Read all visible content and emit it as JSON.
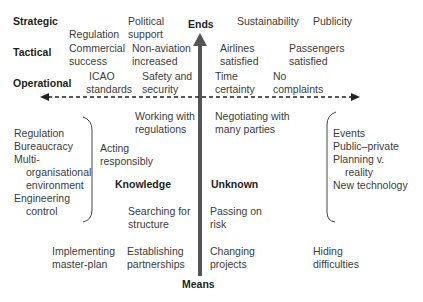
{
  "axes": {
    "vertical": {
      "top_label": "Ends",
      "bottom_label": "Means"
    },
    "horizontal": {
      "style": "dashed",
      "bidirectional": true
    }
  },
  "levels": [
    {
      "label": "Strategic"
    },
    {
      "label": "Tactical"
    },
    {
      "label": "Operational"
    }
  ],
  "ends": {
    "strategic": [
      "Regulation",
      "Political support",
      "Sustainability",
      "Publicity"
    ],
    "tactical": [
      "Commercial success",
      "Non-aviation increased",
      "Airlines satisfied",
      "Passengers satisfied"
    ],
    "operational": [
      "ICAO standards",
      "Safety and security",
      "Time certainty",
      "No complaints"
    ]
  },
  "quadrants": {
    "knowledge": {
      "label": "Knowledge",
      "items": [
        "Working with regulations",
        "Acting responsibly",
        "Searching for structure"
      ]
    },
    "unknown": {
      "label": "Unknown",
      "items": [
        "Negotiating with many parties",
        "Passing on risk"
      ]
    }
  },
  "left_group": {
    "items": [
      "Regulation",
      "Bureaucracy",
      "Multi-",
      "organisational",
      "environment",
      "Engineering",
      "control"
    ]
  },
  "right_group": {
    "items": [
      "Events",
      "Public–private",
      "Planning v.",
      "reality",
      "New technology"
    ]
  },
  "means": [
    "Implementing master-plan",
    "Establishing partnerships",
    "Changing projects",
    "Hiding difficulties"
  ],
  "text": {
    "reg1": "Regulation",
    "pol1": "Political",
    "pol2": "support",
    "sust": "Sustainability",
    "pub": "Publicity",
    "com1": "Commercial",
    "com2": "success",
    "non1": "Non-aviation",
    "non2": "increased",
    "air1": "Airlines",
    "air2": "satisfied",
    "pas1": "Passengers",
    "pas2": "satisfied",
    "icao1": "ICAO",
    "icao2": "standards",
    "saf1": "Safety and",
    "saf2": "security",
    "time1": "Time",
    "time2": "certainty",
    "noc1": "No",
    "noc2": "complaints",
    "wwr1": "Working with",
    "wwr2": "regulations",
    "neg1": "Negotiating with",
    "neg2": "many parties",
    "act1": "Acting",
    "act2": "responsibly",
    "sfs1": "Searching for",
    "sfs2": "structure",
    "por1": "Passing on",
    "por2": "risk",
    "imp1": "Implementing",
    "imp2": "master-plan",
    "est1": "Establishing",
    "est2": "partnerships",
    "chg1": "Changing",
    "chg2": "projects",
    "hid1": "Hiding",
    "hid2": "difficulties"
  },
  "colors": {
    "arrow": "#555555",
    "text": "#3c3c3c",
    "bold_text": "#1e1e1e"
  }
}
